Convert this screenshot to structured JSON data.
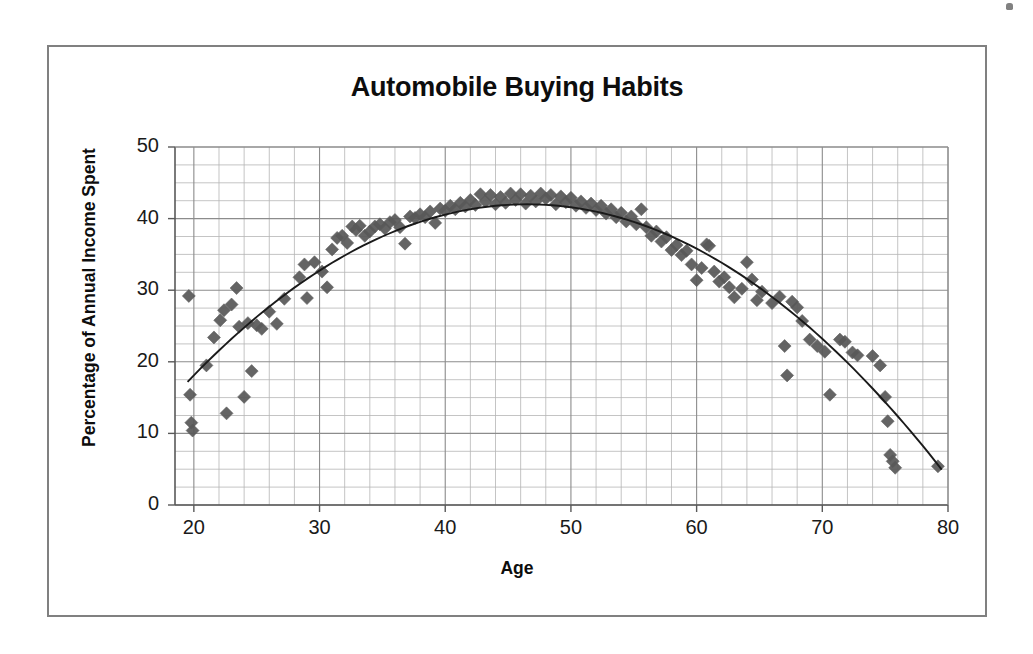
{
  "figure": {
    "title": "Automobile Buying Habits",
    "frame_color": "#808080",
    "background": "#ffffff"
  },
  "axes": {
    "x_label": "Age",
    "y_label": "Percentage of Annual Income Spent",
    "x_ticks": [
      "20",
      "30",
      "40",
      "50",
      "60",
      "70",
      "80"
    ],
    "y_ticks": [
      "50",
      "40",
      "30",
      "20",
      "10",
      "0"
    ]
  },
  "chart_data": {
    "type": "scatter",
    "title": "Automobile Buying Habits",
    "xlabel": "Age",
    "ylabel": "Percentage of Annual Income Spent",
    "xlim": [
      18.5,
      80
    ],
    "ylim": [
      0,
      50
    ],
    "xticks": [
      20,
      30,
      40,
      50,
      60,
      70,
      80
    ],
    "yticks": [
      0,
      10,
      20,
      30,
      40,
      50
    ],
    "x_minor_step": 2,
    "y_minor_step": 2.5,
    "grid": "major-and-minor",
    "legend": "none",
    "marker": {
      "shape": "diamond",
      "color": "#595959",
      "size_px": 13
    },
    "trendline": {
      "present": true,
      "type": "quadratic",
      "color": "#1a1a1a",
      "vertex_x": 46.5,
      "vertex_y": 42.0,
      "x_start": 19.5,
      "y_start": 17.2,
      "x_end": 79.5,
      "y_end": 0.6,
      "note": "downward-opening parabola fitted through the scatter"
    },
    "series": [
      {
        "name": "Percentage of Annual Income Spent vs Age",
        "points": [
          [
            19.6,
            29.2
          ],
          [
            19.7,
            15.4
          ],
          [
            19.8,
            11.5
          ],
          [
            19.9,
            10.4
          ],
          [
            21.0,
            19.5
          ],
          [
            21.6,
            23.4
          ],
          [
            22.1,
            25.8
          ],
          [
            22.4,
            27.2
          ],
          [
            22.6,
            12.8
          ],
          [
            23.0,
            28.0
          ],
          [
            23.4,
            30.3
          ],
          [
            23.6,
            24.9
          ],
          [
            24.0,
            15.1
          ],
          [
            24.3,
            25.4
          ],
          [
            24.6,
            18.7
          ],
          [
            25.0,
            25.1
          ],
          [
            25.4,
            24.6
          ],
          [
            26.0,
            27.0
          ],
          [
            26.6,
            25.3
          ],
          [
            27.2,
            28.8
          ],
          [
            28.4,
            31.8
          ],
          [
            28.8,
            33.6
          ],
          [
            29.0,
            28.9
          ],
          [
            29.6,
            33.9
          ],
          [
            30.2,
            32.6
          ],
          [
            30.6,
            30.4
          ],
          [
            31.0,
            35.7
          ],
          [
            31.4,
            37.3
          ],
          [
            31.8,
            37.6
          ],
          [
            32.2,
            36.6
          ],
          [
            32.6,
            38.9
          ],
          [
            32.9,
            38.4
          ],
          [
            33.2,
            39.0
          ],
          [
            33.6,
            37.6
          ],
          [
            34.0,
            38.2
          ],
          [
            34.4,
            38.9
          ],
          [
            34.8,
            39.2
          ],
          [
            35.2,
            38.6
          ],
          [
            35.6,
            39.5
          ],
          [
            36.0,
            39.8
          ],
          [
            36.4,
            38.8
          ],
          [
            36.8,
            36.5
          ],
          [
            37.2,
            40.3
          ],
          [
            37.6,
            40.1
          ],
          [
            38.0,
            40.6
          ],
          [
            38.4,
            40.2
          ],
          [
            38.8,
            41.0
          ],
          [
            39.2,
            39.4
          ],
          [
            39.6,
            41.4
          ],
          [
            40.0,
            41.1
          ],
          [
            40.4,
            41.8
          ],
          [
            40.8,
            41.3
          ],
          [
            41.2,
            42.2
          ],
          [
            41.6,
            41.7
          ],
          [
            42.0,
            42.6
          ],
          [
            42.4,
            41.9
          ],
          [
            42.8,
            43.4
          ],
          [
            43.2,
            42.4
          ],
          [
            43.6,
            43.3
          ],
          [
            44.0,
            42.0
          ],
          [
            44.4,
            43.0
          ],
          [
            44.8,
            42.2
          ],
          [
            45.2,
            43.5
          ],
          [
            45.6,
            42.6
          ],
          [
            46.0,
            43.4
          ],
          [
            46.4,
            42.1
          ],
          [
            46.8,
            43.2
          ],
          [
            47.2,
            42.4
          ],
          [
            47.6,
            43.5
          ],
          [
            48.0,
            42.8
          ],
          [
            48.4,
            43.3
          ],
          [
            48.8,
            42.0
          ],
          [
            49.2,
            43.1
          ],
          [
            49.6,
            42.3
          ],
          [
            50.0,
            42.9
          ],
          [
            50.4,
            41.8
          ],
          [
            50.8,
            42.4
          ],
          [
            51.2,
            41.5
          ],
          [
            51.6,
            42.1
          ],
          [
            52.0,
            41.2
          ],
          [
            52.4,
            41.8
          ],
          [
            52.8,
            40.7
          ],
          [
            53.2,
            41.3
          ],
          [
            53.6,
            40.2
          ],
          [
            54.0,
            40.8
          ],
          [
            54.4,
            39.6
          ],
          [
            54.8,
            40.3
          ],
          [
            55.2,
            39.2
          ],
          [
            55.6,
            41.3
          ],
          [
            56.0,
            38.8
          ],
          [
            56.4,
            37.6
          ],
          [
            56.8,
            38.2
          ],
          [
            57.2,
            36.8
          ],
          [
            57.6,
            37.4
          ],
          [
            58.0,
            35.6
          ],
          [
            58.4,
            36.3
          ],
          [
            58.8,
            34.9
          ],
          [
            59.2,
            35.5
          ],
          [
            59.6,
            33.6
          ],
          [
            60.0,
            31.4
          ],
          [
            60.4,
            33.1
          ],
          [
            60.8,
            36.4
          ],
          [
            61.0,
            36.2
          ],
          [
            61.4,
            32.6
          ],
          [
            61.8,
            31.2
          ],
          [
            62.2,
            31.8
          ],
          [
            62.6,
            30.4
          ],
          [
            63.0,
            29.0
          ],
          [
            63.6,
            30.2
          ],
          [
            64.0,
            33.9
          ],
          [
            64.4,
            31.5
          ],
          [
            64.8,
            28.6
          ],
          [
            65.2,
            29.8
          ],
          [
            66.0,
            28.2
          ],
          [
            66.6,
            29.1
          ],
          [
            67.0,
            22.2
          ],
          [
            67.2,
            18.1
          ],
          [
            67.6,
            28.4
          ],
          [
            68.0,
            27.6
          ],
          [
            68.4,
            25.7
          ],
          [
            69.0,
            23.1
          ],
          [
            69.6,
            22.2
          ],
          [
            70.2,
            21.4
          ],
          [
            70.6,
            15.4
          ],
          [
            71.4,
            23.1
          ],
          [
            71.8,
            22.8
          ],
          [
            72.4,
            21.3
          ],
          [
            72.8,
            20.9
          ],
          [
            74.0,
            20.8
          ],
          [
            74.6,
            19.5
          ],
          [
            75.0,
            15.1
          ],
          [
            75.2,
            11.7
          ],
          [
            75.4,
            7.0
          ],
          [
            75.6,
            6.1
          ],
          [
            75.8,
            5.2
          ],
          [
            79.2,
            5.4
          ]
        ]
      }
    ]
  }
}
